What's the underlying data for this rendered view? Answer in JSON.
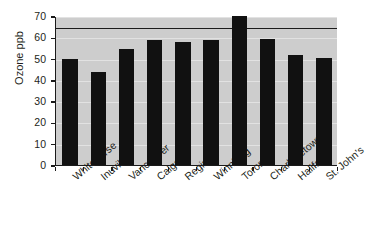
{
  "chart_data": {
    "type": "bar",
    "title": "",
    "subtitle": "",
    "xlabel": "",
    "ylabel": "Ozone ppb",
    "categories": [
      "Whitehorse",
      "Inuvik",
      "Vancouver",
      "Calgary",
      "Regina",
      "Winnipeg",
      "Toronto",
      "Charlottetown",
      "Halifax",
      "St. John's"
    ],
    "values": [
      49.7,
      43.8,
      54.6,
      58.9,
      57.7,
      58.5,
      70.0,
      59.2,
      51.7,
      50.5
    ],
    "series": [
      {
        "name": "Ozone ppb",
        "values": [
          49.7,
          43.8,
          54.6,
          58.9,
          57.7,
          58.5,
          70.0,
          59.2,
          51.7,
          50.5
        ]
      }
    ],
    "ylim": [
      0,
      70
    ],
    "yticks": [
      0,
      10,
      20,
      30,
      40,
      50,
      60,
      70
    ],
    "ytick_labels": [
      "0",
      "10",
      "20",
      "30",
      "40",
      "50",
      "60",
      "70"
    ],
    "grid": true,
    "grid_axis": "y",
    "legend": false,
    "legend_position": "none",
    "annotations": [
      {
        "type": "reference-line",
        "orientation": "horizontal",
        "value": 65,
        "label": ""
      }
    ],
    "colors": {
      "bar": "#111111",
      "plot_background": "#cdcdcd",
      "gridline": "#e2e2e2",
      "axis": "#1a1a1a",
      "reference_line": "#1a1a1a",
      "text": "#231f20",
      "page_background": "#ffffff"
    }
  }
}
